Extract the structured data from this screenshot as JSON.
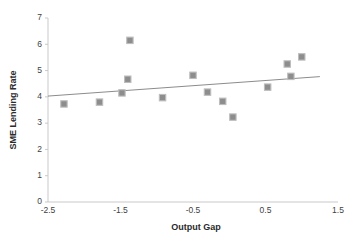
{
  "chart_data": {
    "type": "scatter",
    "title": "",
    "xlabel": "Output Gap",
    "ylabel": "SME Lending Rate",
    "xlim": [
      -2.5,
      1.5
    ],
    "ylim": [
      0,
      7
    ],
    "xticks": [
      "-2.5",
      "-1.5",
      "-0.5",
      "0.5",
      "1.5"
    ],
    "xtick_values": [
      -2.5,
      -1.5,
      -0.5,
      0.5,
      1.5
    ],
    "yticks": [
      "0",
      "1",
      "2",
      "3",
      "4",
      "5",
      "6",
      "7"
    ],
    "ytick_values": [
      0,
      1,
      2,
      3,
      4,
      5,
      6,
      7
    ],
    "grid": false,
    "legend": false,
    "marker_shape": "square",
    "marker_color": "#8d8d8d",
    "marker_edge_color": "#bdbdbd",
    "trendline_color": "#8c8c8c",
    "axis_color": "#c9c9c9",
    "points": [
      {
        "x": -2.28,
        "y": 3.73
      },
      {
        "x": -1.79,
        "y": 3.8
      },
      {
        "x": -1.48,
        "y": 4.15
      },
      {
        "x": -1.37,
        "y": 6.15
      },
      {
        "x": -1.4,
        "y": 4.67
      },
      {
        "x": -0.92,
        "y": 3.97
      },
      {
        "x": -0.5,
        "y": 4.82
      },
      {
        "x": -0.3,
        "y": 4.18
      },
      {
        "x": -0.09,
        "y": 3.83
      },
      {
        "x": 0.05,
        "y": 3.23
      },
      {
        "x": 0.53,
        "y": 4.37
      },
      {
        "x": 0.8,
        "y": 5.25
      },
      {
        "x": 0.85,
        "y": 4.78
      },
      {
        "x": 1.0,
        "y": 5.52
      }
    ],
    "trendline": {
      "x0": -2.5,
      "y0": 4.03,
      "x1": 1.25,
      "y1": 4.77
    }
  }
}
